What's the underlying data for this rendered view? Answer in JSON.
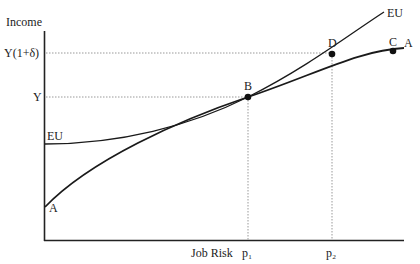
{
  "axes": {
    "y_title": "Income",
    "x_title": "Job Risk",
    "y_ticks": [
      "Y(1+δ)",
      "Y"
    ],
    "x_ticks": [
      "p₁",
      "p₂"
    ]
  },
  "curves": {
    "eu_label_top": "EU",
    "eu_label_left": "EU",
    "a_label_right": "A",
    "a_label_left": "A"
  },
  "points": {
    "b": "B",
    "c": "C",
    "d": "D"
  },
  "colors": {
    "line": "#1a1a1a",
    "guide": "#999999"
  }
}
